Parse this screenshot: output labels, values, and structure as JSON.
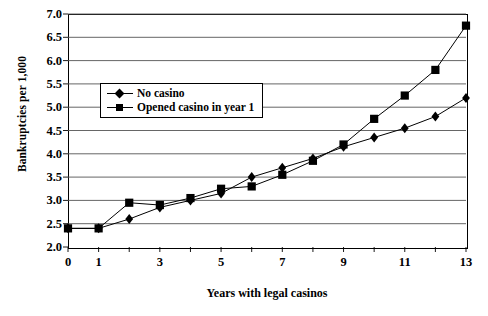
{
  "chart_data": {
    "type": "line",
    "title": "",
    "xlabel": "Years with legal casinos",
    "ylabel": "Bankruptcies per 1,000",
    "x": [
      0,
      1,
      2,
      3,
      4,
      5,
      6,
      7,
      8,
      9,
      10,
      11,
      12,
      13
    ],
    "xlim": [
      0,
      13
    ],
    "ylim": [
      2.0,
      7.0
    ],
    "grid": true,
    "legend_position": "upper-left-inside",
    "y_ticks": [
      "2.0",
      "2.5",
      "3.0",
      "3.5",
      "4.0",
      "4.5",
      "5.0",
      "5.5",
      "6.0",
      "6.5",
      "7.0"
    ],
    "y_tick_values": [
      2.0,
      2.5,
      3.0,
      3.5,
      4.0,
      4.5,
      5.0,
      5.5,
      6.0,
      6.5,
      7.0
    ],
    "x_ticks": [
      "0",
      "1",
      "3",
      "5",
      "7",
      "9",
      "11",
      "13"
    ],
    "x_tick_values": [
      0,
      1,
      3,
      5,
      7,
      9,
      11,
      13
    ],
    "x_minor_ticks": [
      0,
      1,
      2,
      3,
      4,
      5,
      6,
      7,
      8,
      9,
      10,
      11,
      12,
      13
    ],
    "series": [
      {
        "name": "No casino",
        "marker": "diamond",
        "color": "#000000",
        "values": [
          2.4,
          2.4,
          2.6,
          2.85,
          3.0,
          3.15,
          3.5,
          3.7,
          3.9,
          4.15,
          4.35,
          4.55,
          4.8,
          5.2
        ]
      },
      {
        "name": "Opened casino in year 1",
        "marker": "square",
        "color": "#000000",
        "values": [
          2.4,
          2.4,
          2.95,
          2.9,
          3.05,
          3.25,
          3.3,
          3.55,
          3.85,
          4.2,
          4.75,
          5.25,
          5.8,
          6.75
        ]
      }
    ]
  },
  "legend": {
    "items": [
      {
        "label": "No casino",
        "marker": "diamond"
      },
      {
        "label": "Opened casino in year 1",
        "marker": "square"
      }
    ]
  },
  "axes": {
    "y_title": "Bankruptcies per 1,000",
    "x_title": "Years with legal casinos"
  }
}
